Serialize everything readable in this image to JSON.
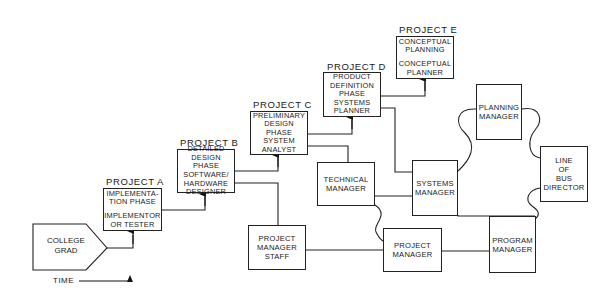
{
  "diagram": {
    "type": "career-path-organization-chart",
    "start": {
      "line1": "COLLEGE",
      "line2": "GRAD"
    },
    "time_label": "TIME",
    "projects": [
      {
        "label": "PROJECT A",
        "phase": [
          "IMPLEMENTA-",
          "TION PHASE"
        ],
        "role": [
          "IMPLEMENTOR",
          "OR TESTER"
        ]
      },
      {
        "label": "PROJECT B",
        "phase": [
          "DETAILED",
          "DESIGN PHASE"
        ],
        "role": [
          "SOFTWARE/",
          "HARDWARE",
          "DESIGNER"
        ]
      },
      {
        "label": "PROJECT C",
        "phase": [
          "PRELIMINARY",
          "DESIGN",
          "PHASE"
        ],
        "role": [
          "SYSTEM",
          "ANALYST"
        ]
      },
      {
        "label": "PROJECT D",
        "phase": [
          "PRODUCT",
          "DEFINITION",
          "PHASE"
        ],
        "role": [
          "SYSTEMS",
          "PLANNER"
        ]
      },
      {
        "label": "PROJECT E",
        "phase": [
          "CONCEPTUAL",
          "PLANNING"
        ],
        "role": [
          "CONCEPTUAL",
          "PLANNER"
        ]
      }
    ],
    "roles": {
      "technical_manager": [
        "TECHNICAL",
        "MANAGER"
      ],
      "systems_manager": [
        "SYSTEMS",
        "MANAGER"
      ],
      "planning_manager": [
        "PLANNING",
        "MANAGER"
      ],
      "line_of_bus_director": [
        "LINE",
        "OF",
        "BUS",
        "DIRECTOR"
      ],
      "project_manager_staff": [
        "PROJECT",
        "MANAGER",
        "STAFF"
      ],
      "project_manager": [
        "PROJECT",
        "MANAGER"
      ],
      "program_manager": [
        "PROGRAM",
        "MANAGER"
      ]
    }
  }
}
